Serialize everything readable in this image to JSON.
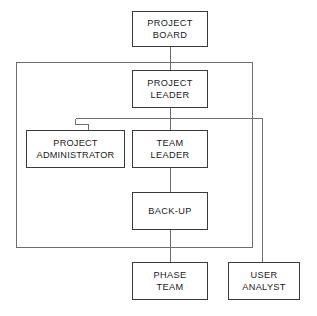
{
  "diagram": {
    "type": "organisation-chart",
    "background_color": "#ffffff",
    "line_color": "#3a3a3a",
    "text_color": "#1a1a1a",
    "nodes": [
      {
        "id": "project-board",
        "lines": [
          "PROJECT",
          "BOARD"
        ],
        "line1": "PROJECT",
        "line2": "BOARD",
        "x": 132,
        "y": 11,
        "w": 76,
        "h": 36,
        "level": 1
      },
      {
        "id": "project-leader",
        "lines": [
          "PROJECT",
          "LEADER"
        ],
        "line1": "PROJECT",
        "line2": "LEADER",
        "x": 132,
        "y": 70,
        "w": 76,
        "h": 38,
        "level": 2
      },
      {
        "id": "project-administrator",
        "lines": [
          "PROJECT",
          "ADMINISTRATOR"
        ],
        "line1": "PROJECT",
        "line2": "ADMINISTRATOR",
        "x": 26,
        "y": 130,
        "w": 99,
        "h": 38,
        "level": 3
      },
      {
        "id": "team-leader",
        "lines": [
          "TEAM",
          "LEADER"
        ],
        "line1": "TEAM",
        "line2": "LEADER",
        "x": 132,
        "y": 130,
        "w": 76,
        "h": 38,
        "level": 3
      },
      {
        "id": "back-up",
        "lines": [
          "BACK-UP"
        ],
        "line1": "BACK-UP",
        "line2": "",
        "x": 132,
        "y": 192,
        "w": 76,
        "h": 38,
        "level": 4
      },
      {
        "id": "phase-team",
        "lines": [
          "PHASE",
          "TEAM"
        ],
        "line1": "PHASE",
        "line2": "TEAM",
        "x": 132,
        "y": 262,
        "w": 76,
        "h": 38,
        "level": 5
      },
      {
        "id": "user-analyst",
        "lines": [
          "USER",
          "ANALYST"
        ],
        "line1": "USER",
        "line2": "ANALYST",
        "x": 228,
        "y": 262,
        "w": 72,
        "h": 38,
        "level": 5
      }
    ],
    "connectors": [
      {
        "id": "board-to-bus",
        "from": "project-board",
        "to": "outer-bus",
        "kind": "vertical"
      },
      {
        "id": "bus-to-leader",
        "from": "outer-bus",
        "to": "project-leader",
        "kind": "vertical"
      },
      {
        "id": "leader-to-splitter",
        "from": "project-leader",
        "to": "splitter-bus",
        "kind": "vertical"
      },
      {
        "id": "splitter-to-admin",
        "from": "splitter-bus",
        "to": "project-administrator",
        "kind": "elbow"
      },
      {
        "id": "splitter-to-team",
        "from": "splitter-bus",
        "to": "team-leader",
        "kind": "vertical"
      },
      {
        "id": "splitter-to-analyst",
        "from": "splitter-bus",
        "to": "user-analyst",
        "kind": "elbow"
      },
      {
        "id": "team-to-backup",
        "from": "team-leader",
        "to": "back-up",
        "kind": "vertical"
      },
      {
        "id": "backup-to-phase",
        "from": "back-up",
        "to": "phase-team",
        "kind": "vertical"
      },
      {
        "id": "outer-loop",
        "from": "outer-bus",
        "to": "splitter-bus",
        "kind": "rectangle"
      }
    ]
  }
}
